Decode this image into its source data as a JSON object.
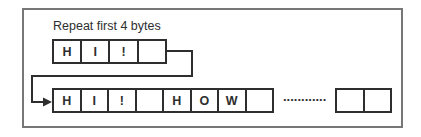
{
  "diagram": {
    "label": "Repeat first 4 bytes",
    "top_row": {
      "cells": [
        "H",
        "I",
        "!",
        ""
      ]
    },
    "bottom_row": {
      "cells": [
        "H",
        "I",
        "!",
        "",
        "H",
        "O",
        "W",
        ""
      ]
    },
    "tail_row": {
      "cells": [
        "",
        ""
      ]
    },
    "ellipsis": "............",
    "colors": {
      "cell_line": "#2e2e2e",
      "outer_frame": "#777777",
      "background": "#ffffff"
    },
    "icons": [
      "arrow-right-icon"
    ]
  }
}
